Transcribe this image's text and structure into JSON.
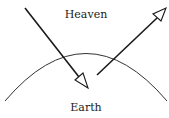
{
  "diagram": {
    "labels": {
      "top": "Heaven",
      "bottom": "Earth"
    },
    "elements": [
      {
        "type": "arc",
        "name": "earth-horizon-arc",
        "description": "curved line representing the earth's surface"
      },
      {
        "type": "arrow",
        "name": "descending-arrow",
        "direction": "down-right",
        "description": "arrow from heaven crossing into earth"
      },
      {
        "type": "arrow",
        "name": "ascending-arrow",
        "direction": "up-right",
        "description": "arrow from earth rising into heaven"
      }
    ],
    "colors": {
      "stroke": "#1a1a1a",
      "background": "#ffffff"
    }
  }
}
